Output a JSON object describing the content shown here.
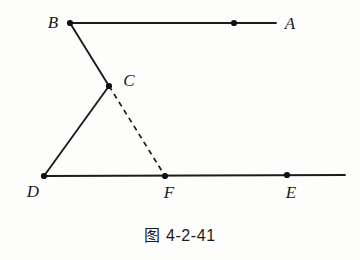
{
  "figure": {
    "caption": "图 4-2-41",
    "background_color": "#fdfdfc",
    "stroke_color": "#1c1c1c",
    "points": [
      {
        "id": "A",
        "label": "A",
        "label_x": 290,
        "label_y": 23,
        "dot_x": 234,
        "dot_y": 23,
        "has_dot": true
      },
      {
        "id": "B",
        "label": "B",
        "label_x": 53,
        "label_y": 22,
        "dot_x": 70,
        "dot_y": 23,
        "has_dot": true
      },
      {
        "id": "C",
        "label": "C",
        "label_x": 129,
        "label_y": 80,
        "dot_x": 109,
        "dot_y": 86,
        "has_dot": true
      },
      {
        "id": "D",
        "label": "D",
        "label_x": 33,
        "label_y": 191,
        "dot_x": 44,
        "dot_y": 176,
        "has_dot": true
      },
      {
        "id": "E",
        "label": "E",
        "label_x": 291,
        "label_y": 192,
        "dot_x": 287,
        "dot_y": 175,
        "has_dot": true
      },
      {
        "id": "F",
        "label": "F",
        "label_x": 169,
        "label_y": 192,
        "dot_x": 165,
        "dot_y": 176,
        "has_dot": true
      }
    ],
    "segments": [
      {
        "id": "ray-BA",
        "from": "B",
        "to": "A",
        "style": "solid",
        "x1": 70,
        "y1": 23,
        "x2": 276,
        "y2": 23
      },
      {
        "id": "seg-BC",
        "from": "B",
        "to": "C",
        "style": "solid",
        "x1": 70,
        "y1": 23,
        "x2": 109,
        "y2": 86
      },
      {
        "id": "seg-CD",
        "from": "C",
        "to": "D",
        "style": "solid",
        "x1": 109,
        "y1": 86,
        "x2": 44,
        "y2": 176
      },
      {
        "id": "ray-DE",
        "from": "D",
        "to": "E",
        "style": "solid",
        "x1": 44,
        "y1": 176,
        "x2": 345,
        "y2": 175
      },
      {
        "id": "seg-CF",
        "from": "C",
        "to": "F",
        "style": "dashed",
        "x1": 109,
        "y1": 86,
        "x2": 165,
        "y2": 176
      }
    ]
  }
}
